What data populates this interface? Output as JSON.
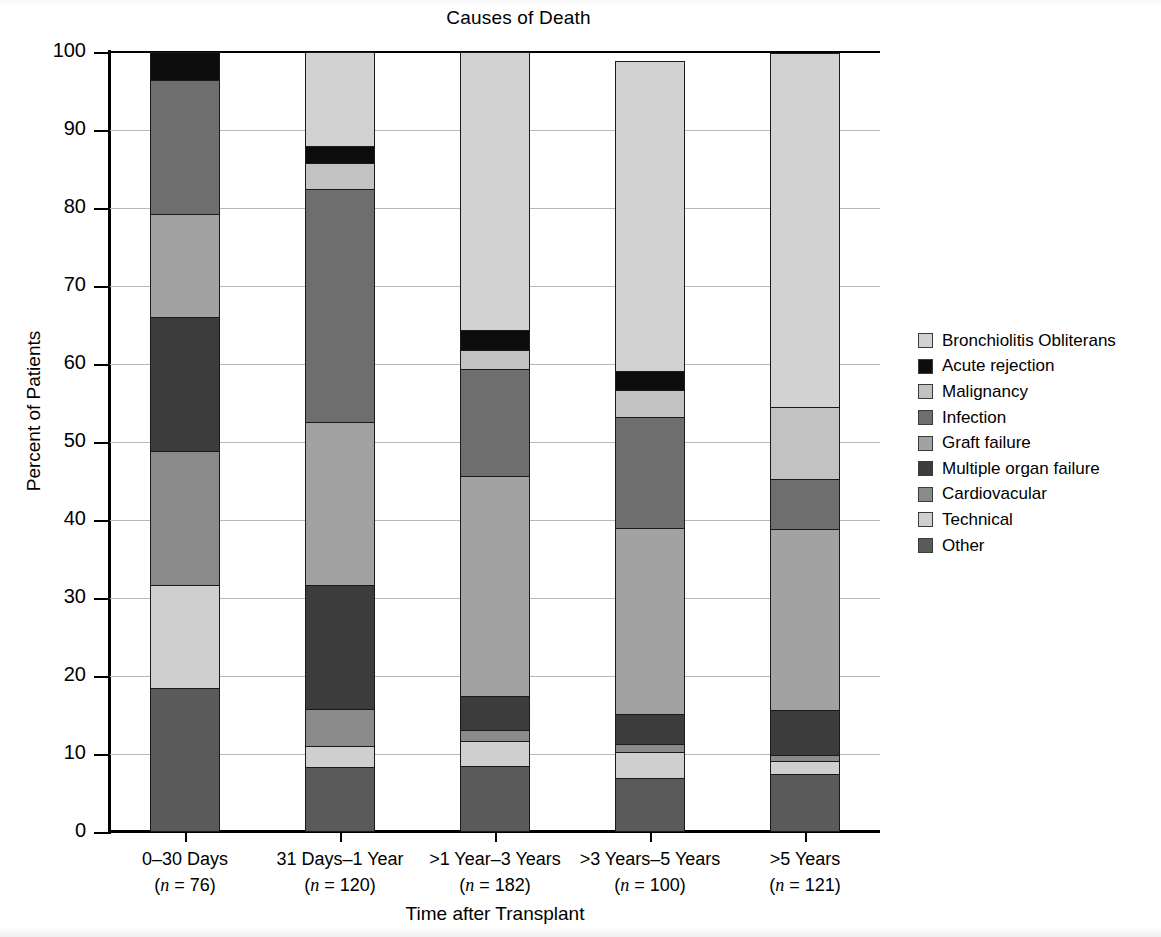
{
  "chart_data": {
    "type": "bar",
    "subtype": "stacked-bar-100",
    "title": "Causes of Death",
    "xlabel": "Time after Transplant",
    "ylabel": "Percent of Patients",
    "ylim": [
      0,
      100
    ],
    "ytick_labels": [
      "0",
      "10",
      "20",
      "30",
      "40",
      "50",
      "60",
      "70",
      "80",
      "90",
      "100"
    ],
    "ytick_values": [
      0,
      10,
      20,
      30,
      40,
      50,
      60,
      70,
      80,
      90,
      100
    ],
    "grid": true,
    "legend_position": "right",
    "categories": [
      {
        "label": "0–30 Days",
        "n_label": "(n = 76)",
        "n": 76
      },
      {
        "label": "31 Days–1 Year",
        "n_label": "(n = 120)",
        "n": 120
      },
      {
        "label": ">1 Year–3 Years",
        "n_label": "(n = 182)",
        "n": 182
      },
      {
        "label": ">3 Years–5 Years",
        "n_label": "(n = 100)",
        "n": 100
      },
      {
        "label": ">5 Years",
        "n_label": "(n = 121)",
        "n": 121
      }
    ],
    "series": [
      {
        "name": "Bronchiolitis Obliterans",
        "color": "#d2d2d2",
        "values": [
          0.0,
          12.0,
          35.7,
          39.8,
          45.4
        ]
      },
      {
        "name": "Acute rejection",
        "color": "#0d0d0d",
        "values": [
          3.6,
          2.2,
          2.5,
          2.4,
          0.0
        ]
      },
      {
        "name": "Malignancy",
        "color": "#c2c2c2",
        "values": [
          0.0,
          3.3,
          2.5,
          3.5,
          9.2
        ]
      },
      {
        "name": "Infection",
        "color": "#6e6e6e",
        "values": [
          17.2,
          29.9,
          13.7,
          14.2,
          6.5
        ]
      },
      {
        "name": "Graft failure",
        "color": "#a2a2a2",
        "values": [
          13.2,
          20.9,
          28.1,
          23.9,
          23.1
        ]
      },
      {
        "name": "Multiple organ failure",
        "color": "#3c3c3c",
        "values": [
          17.2,
          15.9,
          4.4,
          3.8,
          5.8
        ]
      },
      {
        "name": "Cardiovacular",
        "color": "#8a8a8a",
        "values": [
          17.1,
          4.8,
          1.4,
          1.0,
          0.8
        ]
      },
      {
        "name": "Technical",
        "color": "#cfcfcf",
        "values": [
          13.2,
          2.7,
          3.3,
          3.4,
          1.7
        ]
      },
      {
        "name": "Other",
        "color": "#5a5a5a",
        "values": [
          18.5,
          8.3,
          8.4,
          6.9,
          7.4
        ]
      }
    ],
    "stack_order_top_to_bottom": [
      "Bronchiolitis Obliterans",
      "Acute rejection",
      "Malignancy",
      "Infection",
      "Graft failure",
      "Multiple organ failure",
      "Cardiovacular",
      "Technical",
      "Other"
    ],
    "stack_boundaries_bottom_to_top": {
      "0–30 Days": [
        0,
        18.5,
        31.7,
        48.8,
        66.0,
        79.2,
        96.4,
        96.4,
        100.0
      ],
      "31 Days–1 Year": [
        0,
        8.3,
        11.0,
        15.8,
        31.7,
        52.6,
        82.5,
        85.8,
        88.0
      ],
      ">1 Year–3 Years": [
        0,
        8.4,
        11.7,
        13.1,
        17.5,
        45.6,
        59.3,
        61.8,
        64.3
      ],
      ">3 Years–5 Years": [
        0,
        6.9,
        10.3,
        11.3,
        15.1,
        39.0,
        53.2,
        56.7,
        59.1
      ],
      ">5 Years": [
        0,
        7.4,
        9.1,
        9.9,
        15.7,
        38.8,
        45.3,
        54.5,
        54.5
      ]
    }
  },
  "legend": {
    "items": [
      {
        "label": "Bronchiolitis Obliterans",
        "color": "#d2d2d2"
      },
      {
        "label": "Acute rejection",
        "color": "#0d0d0d"
      },
      {
        "label": "Malignancy",
        "color": "#c2c2c2"
      },
      {
        "label": "Infection",
        "color": "#6e6e6e"
      },
      {
        "label": "Graft failure",
        "color": "#a2a2a2"
      },
      {
        "label": "Multiple organ failure",
        "color": "#3c3c3c"
      },
      {
        "label": "Cardiovacular",
        "color": "#8a8a8a"
      },
      {
        "label": "Technical",
        "color": "#cfcfcf"
      },
      {
        "label": "Other",
        "color": "#5a5a5a"
      }
    ]
  },
  "ghost_text": {
    "line1": " ",
    "line2": " "
  }
}
